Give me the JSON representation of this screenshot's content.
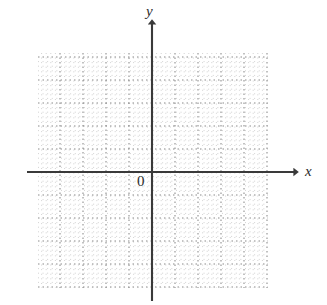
{
  "figure": {
    "type": "coordinate-grid",
    "width": 327,
    "height": 305,
    "background_color": "#ffffff"
  },
  "labels": {
    "y_axis": "y",
    "x_axis": "x",
    "origin": "0"
  },
  "chart_data": {
    "type": "scatter",
    "title": "",
    "subtitle": "",
    "xlabel": "x",
    "ylabel": "y",
    "series": [
      {
        "name": "",
        "x": [],
        "y": []
      }
    ],
    "annotations": [
      {
        "text": "0",
        "x": 0,
        "y": 0,
        "position": "lower-left-of-origin"
      }
    ],
    "grid": true,
    "grid_style": "dotted",
    "legend": false,
    "legend_position": "none",
    "xlim": [
      -5,
      5
    ],
    "ylim": [
      -5,
      5
    ],
    "xticks": [
      -5,
      -4,
      -3,
      -2,
      -1,
      0,
      1,
      2,
      3,
      4,
      5
    ],
    "yticks": [
      -5,
      -4,
      -3,
      -2,
      -1,
      0,
      1,
      2,
      3,
      4,
      5
    ],
    "xtick_labels": [
      "",
      "",
      "",
      "",
      "",
      "0",
      "",
      "",
      "",
      "",
      ""
    ],
    "ytick_labels": [
      "",
      "",
      "",
      "",
      "",
      "",
      "",
      "",
      "",
      "",
      ""
    ],
    "minor_subdivisions": 5,
    "values": []
  },
  "geometry": {
    "grid_left": 38,
    "grid_top": 53,
    "grid_right": 268,
    "grid_bottom": 288,
    "major_step": 23,
    "minor_step": 4.6,
    "origin_x": 152,
    "origin_y": 172,
    "x_axis_start": 27,
    "x_axis_end": 296,
    "y_axis_top": 22,
    "y_axis_bottom": 301
  },
  "colors": {
    "axis": "#3a3a3a",
    "major_grid": "#8a8a8a",
    "minor_grid": "#c8c8c8",
    "text": "#2b2b2b",
    "background": "#ffffff"
  }
}
